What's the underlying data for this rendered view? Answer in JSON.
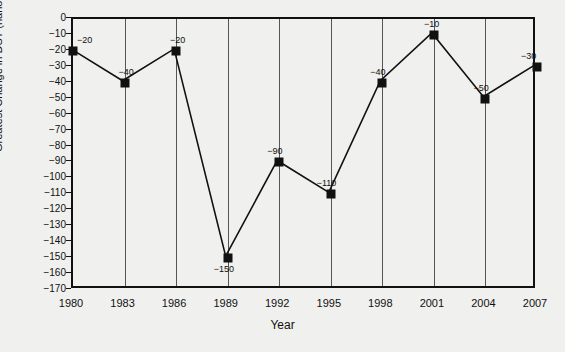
{
  "chart_data": {
    "type": "line",
    "title": "",
    "xlabel": "Year",
    "ylabel": "Greatest Change in DST (nano-Tesla)",
    "categories": [
      1980,
      1983,
      1986,
      1989,
      1992,
      1995,
      1998,
      2001,
      2004,
      2007
    ],
    "x": [
      1980,
      1983,
      1986,
      1989,
      1992,
      1995,
      1998,
      2001,
      2004,
      2007
    ],
    "values": [
      -20,
      -40,
      -20,
      -150,
      -90,
      -110,
      -40,
      -10,
      -50,
      -30
    ],
    "point_labels": [
      "−20",
      "−40",
      "−20",
      "−150",
      "−90",
      "−110",
      "−40",
      "−10",
      "−50",
      "−30"
    ],
    "xlim": [
      1980,
      2007
    ],
    "ylim": [
      -170,
      0
    ],
    "ytick_labels": [
      "0",
      "−10",
      "−20",
      "−30",
      "−40",
      "−50",
      "−60",
      "−70",
      "−80",
      "−90",
      "−100",
      "−110",
      "−120",
      "−130",
      "−140",
      "−150",
      "−160",
      "−170"
    ],
    "ytick_values": [
      0,
      -10,
      -20,
      -30,
      -40,
      -50,
      -60,
      -70,
      -80,
      -90,
      -100,
      -110,
      -120,
      -130,
      -140,
      -150,
      -160,
      -170
    ],
    "xtick_labels": [
      "1980",
      "1983",
      "1986",
      "1989",
      "1992",
      "1995",
      "1998",
      "2001",
      "2004",
      "2007"
    ],
    "grid": "vertical",
    "legend": "none",
    "marker": "square",
    "line_color": "#111111",
    "marker_color": "#111111",
    "background_color": "#f0f0ee"
  },
  "axes": {
    "y_title": "Greatest Change in DST (nano-Tesla)",
    "x_title": "Year"
  }
}
